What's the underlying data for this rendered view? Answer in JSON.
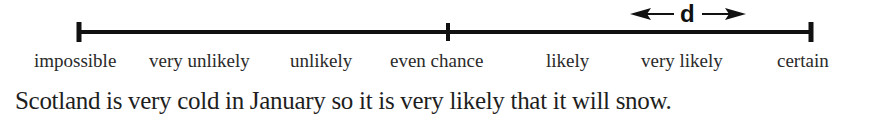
{
  "scale": {
    "labels": [
      {
        "text": "impossible",
        "x": 34
      },
      {
        "text": "very unlikely",
        "x": 149
      },
      {
        "text": "unlikely",
        "x": 290
      },
      {
        "text": "even chance",
        "x": 390
      },
      {
        "text": "likely",
        "x": 546
      },
      {
        "text": "very likely",
        "x": 641
      },
      {
        "text": "certain",
        "x": 777
      }
    ],
    "ticks": [
      "impossible",
      "even chance",
      "certain"
    ],
    "distance_marker": "d",
    "colors": {
      "line": "#111111",
      "text": "#2a2a2a"
    }
  },
  "caption": {
    "sentence": "Scotland is very cold in January so it is very likely that it will snow."
  }
}
